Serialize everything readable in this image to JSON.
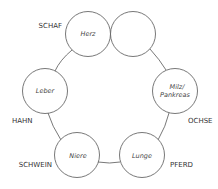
{
  "diagram": {
    "organs": [
      {
        "id": "herz",
        "label": "Herz",
        "cx": 88,
        "cy": 34
      },
      {
        "id": "empty",
        "label": "",
        "cx": 133,
        "cy": 34
      },
      {
        "id": "milz",
        "label_line1": "Milz/",
        "label_line2": "Pankreas",
        "cx": 175,
        "cy": 91
      },
      {
        "id": "lunge",
        "label": "Lunge",
        "cx": 142,
        "cy": 155
      },
      {
        "id": "niere",
        "label": "Niere",
        "cx": 77,
        "cy": 155
      },
      {
        "id": "leber",
        "label": "Leber",
        "cx": 45,
        "cy": 91
      }
    ],
    "animals": {
      "schaf": "SCHAF",
      "ochse": "OCHSE",
      "pferd": "PFERD",
      "schwein": "SCHWEIN",
      "hahn": "HAHN"
    },
    "colors": {
      "stroke": "#555555",
      "background": "#ffffff"
    }
  }
}
